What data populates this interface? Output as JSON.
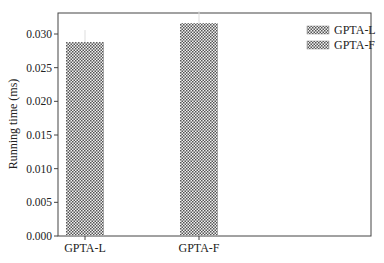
{
  "chart_data": {
    "type": "bar",
    "title": "",
    "xlabel": "",
    "ylabel": "Running time (ms)",
    "categories": [
      "GPTA-L",
      "GPTA-F"
    ],
    "values": [
      0.0288,
      0.0316
    ],
    "series": [
      {
        "name": "GPTA-L",
        "values": [
          0.0288,
          null
        ]
      },
      {
        "name": "GPTA-F",
        "values": [
          null,
          0.0316
        ]
      }
    ],
    "ylim": [
      0,
      0.033
    ],
    "yticks": [
      "0.000",
      "0.005",
      "0.010",
      "0.015",
      "0.020",
      "0.025",
      "0.030"
    ],
    "grid": false,
    "legend_position": "upper right",
    "legend": [
      "GPTA-L",
      "GPTA-F"
    ],
    "bar_pattern": "crosshatch",
    "bar_color": "#555555"
  }
}
